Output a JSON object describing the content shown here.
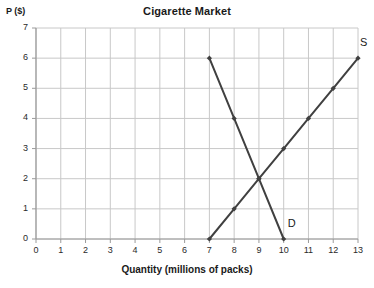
{
  "chart_data": {
    "type": "line",
    "title": "Cigarette Market",
    "xlabel": "Quantity (millions of packs)",
    "ylabel": "P ($)",
    "xlim": [
      0,
      13
    ],
    "ylim": [
      0,
      7
    ],
    "xticks": [
      "0",
      "1",
      "2",
      "3",
      "4",
      "5",
      "6",
      "7",
      "8",
      "9",
      "10",
      "11",
      "12",
      "13"
    ],
    "yticks": [
      "0",
      "1",
      "2",
      "3",
      "4",
      "5",
      "6",
      "7"
    ],
    "grid": true,
    "legend_position": "inline-endpoint-labels",
    "line_color": "#404040",
    "grid_color": "#c8c8c8",
    "series": [
      {
        "name": "Supply",
        "label": "S",
        "label_x": 13,
        "label_y": 6,
        "points": [
          {
            "x": 7,
            "y": 0
          },
          {
            "x": 8,
            "y": 1
          },
          {
            "x": 9,
            "y": 2
          },
          {
            "x": 10,
            "y": 3
          },
          {
            "x": 11,
            "y": 4
          },
          {
            "x": 12,
            "y": 5
          },
          {
            "x": 13,
            "y": 6
          }
        ]
      },
      {
        "name": "Demand",
        "label": "D",
        "label_x": 10,
        "label_y": 0,
        "points": [
          {
            "x": 7,
            "y": 6
          },
          {
            "x": 8,
            "y": 4
          },
          {
            "x": 9,
            "y": 2
          },
          {
            "x": 10,
            "y": 0
          }
        ]
      }
    ],
    "annotations": [
      {
        "name": "equilibrium",
        "x": 9,
        "y": 2
      }
    ]
  }
}
